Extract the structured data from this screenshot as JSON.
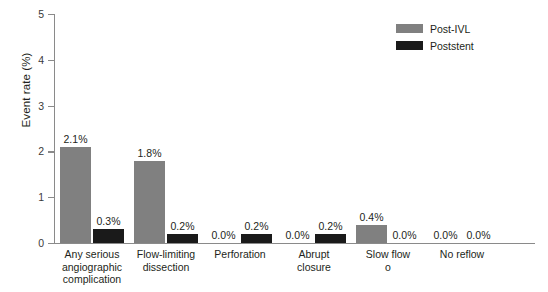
{
  "chart_data": {
    "type": "bar",
    "title": "",
    "xlabel": "",
    "ylabel": "Event rate (%)",
    "ylim": [
      0,
      5
    ],
    "ytick_labels": [
      "0",
      "1",
      "2",
      "3",
      "4",
      "5"
    ],
    "grid": false,
    "legend_position": "top-right",
    "categories": [
      "Any serious angiographic complication",
      "Flow-limiting dissection",
      "Perforation",
      "Abrupt closure",
      "Slow flow o",
      "No reflow"
    ],
    "category_lines": [
      [
        "Any serious",
        "angiographic",
        "complication"
      ],
      [
        "Flow-limiting",
        "dissection"
      ],
      [
        "Perforation"
      ],
      [
        "Abrupt",
        "closure"
      ],
      [
        "Slow flow",
        "o"
      ],
      [
        "No reflow"
      ]
    ],
    "series": [
      {
        "name": "Post-IVL",
        "color": "#808080",
        "values": [
          2.1,
          1.8,
          0.0,
          0.0,
          0.4,
          0.0
        ],
        "labels": [
          "2.1%",
          "1.8%",
          "0.0%",
          "0.0%",
          "0.4%",
          "0.0%"
        ]
      },
      {
        "name": "Poststent",
        "color": "#1a1a1a",
        "values": [
          0.3,
          0.2,
          0.2,
          0.2,
          0.0,
          0.0
        ],
        "labels": [
          "0.3%",
          "0.2%",
          "0.2%",
          "0.2%",
          "0.0%",
          "0.0%"
        ]
      }
    ]
  },
  "axes": {
    "y_title": "Event rate (%)",
    "y_ticks": [
      "5",
      "4",
      "3",
      "2",
      "1",
      "0"
    ]
  },
  "legend": {
    "items": [
      {
        "label": "Post-IVL",
        "color": "#808080"
      },
      {
        "label": "Poststent",
        "color": "#1a1a1a"
      }
    ]
  }
}
